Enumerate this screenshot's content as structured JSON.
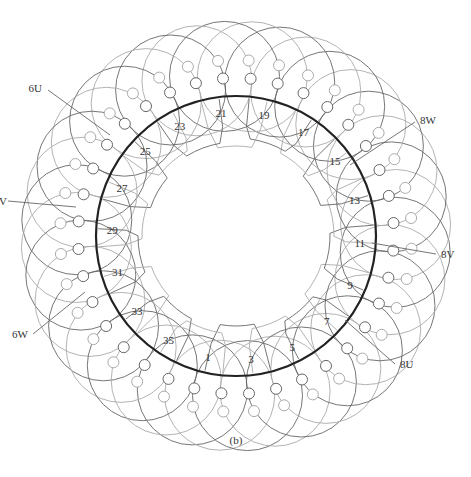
{
  "figure": {
    "caption": "(b)",
    "type": "stator winding diagram",
    "slot_count": 36,
    "slot_labels": [
      "1",
      "3",
      "5",
      "7",
      "9",
      "11",
      "13",
      "15",
      "17",
      "19",
      "21",
      "23",
      "25",
      "27",
      "29",
      "31",
      "33",
      "35"
    ],
    "phase_leads": [
      {
        "label": "6U"
      },
      {
        "label": "8W"
      },
      {
        "label": "8V"
      },
      {
        "label": "8U"
      },
      {
        "label": "6W"
      },
      {
        "label": "6V",
        "visible_text": "V"
      }
    ],
    "colors": {
      "stator_ring": "#222222",
      "coil_dark": "#666666",
      "coil_light": "#aaaaaa",
      "text": "#333333"
    }
  }
}
